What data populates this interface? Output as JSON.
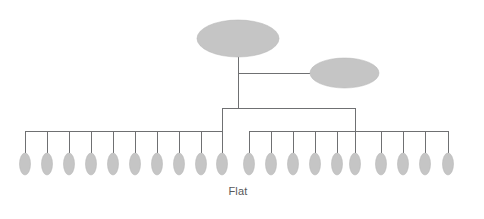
{
  "figure": {
    "caption": "Flat",
    "credit": "© Cengage Learning",
    "background_color": "#ffffff",
    "node_fill_color": "#c5c5c5",
    "node_stroke_color": "#b0b0b0",
    "line_color": "#6f7072",
    "caption_color": "#58585a",
    "credit_color": "#8d8d8f",
    "diagram_type": "organizational-chart",
    "structure_name": "Flat",
    "counts": {
      "top_level_nodes": 1,
      "staff_nodes": 1,
      "left_branch_leaf_nodes": 10,
      "right_branch_leaf_nodes": 10,
      "total_leaf_nodes": 20,
      "hierarchy_levels": 2
    },
    "nodes": {
      "executive": {
        "name": "executive-node",
        "cx": 238,
        "cy": 38.5,
        "rx": 41,
        "ry": 18.5
      },
      "staff": {
        "name": "staff-node",
        "cx": 344.5,
        "cy": 73,
        "rx": 34.5,
        "ry": 15
      }
    },
    "leaf_geometry": {
      "rx": 5.5,
      "ry": 11,
      "cy": 164,
      "drop_top_left": 131,
      "drop_top_right": 131,
      "left_positions": [
        25,
        47,
        69,
        91,
        113,
        135,
        157,
        179,
        201,
        222
      ],
      "right_positions": [
        249,
        271,
        293,
        315,
        337,
        355,
        381,
        403,
        425,
        448
      ]
    },
    "connectors": {
      "executive_stem_x": 238,
      "executive_stem_top": 57,
      "executive_stem_bottom": 108,
      "staff_branch_y": 73,
      "staff_branch_from_x": 238,
      "staff_branch_to_x": 310,
      "main_bus_y": 108,
      "main_bus_left_x": 222,
      "main_bus_right_x": 355,
      "left_bar_y": 131,
      "left_bar_from_x": 25,
      "left_bar_to_x": 222,
      "right_bar_y": 131,
      "right_bar_from_x": 249,
      "right_bar_to_x": 448
    }
  }
}
